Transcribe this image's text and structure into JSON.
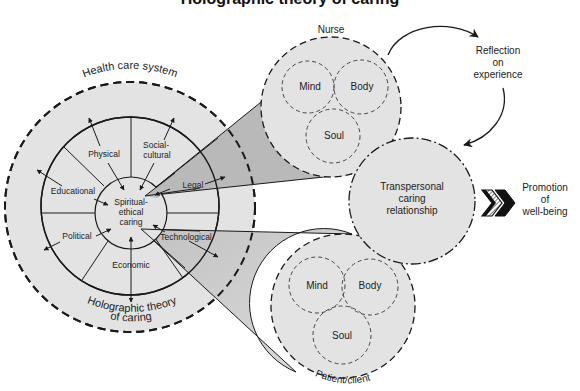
{
  "title_partial": "Holographic theory of caring",
  "health_system": {
    "outer_label": "Health care system",
    "bottom_label_line1": "Holographic theory",
    "bottom_label_line2": "of caring",
    "center_label": [
      "Spiritual-",
      "ethical",
      "caring"
    ],
    "dimensions": [
      {
        "id": "physical",
        "label": [
          "Physical"
        ]
      },
      {
        "id": "social-cultural",
        "label": [
          "Social-",
          "cultural"
        ]
      },
      {
        "id": "educational",
        "label": [
          "Educational"
        ]
      },
      {
        "id": "legal",
        "label": [
          "Legal"
        ]
      },
      {
        "id": "political",
        "label": [
          "Political"
        ]
      },
      {
        "id": "technological",
        "label": [
          "Technological"
        ]
      },
      {
        "id": "economic",
        "label": [
          "Economic"
        ]
      }
    ]
  },
  "nurse": {
    "label": "Nurse",
    "parts": [
      "Mind",
      "Body",
      "Soul"
    ]
  },
  "patient": {
    "label": "Patient/client",
    "parts": [
      "Mind",
      "Body",
      "Soul"
    ]
  },
  "relationship": {
    "label": [
      "Transpersonal",
      "caring",
      "relationship"
    ]
  },
  "reflection": {
    "label": [
      "Reflection",
      "on",
      "experience"
    ]
  },
  "outcome": {
    "label": [
      "Promotion",
      "of",
      "well-being"
    ]
  },
  "colors": {
    "circle_fill": "#e3e3e3",
    "wedge_upper": "#b9b9b9",
    "wedge_lower": "#cfcfcf",
    "stroke": "#1a1a1a"
  }
}
